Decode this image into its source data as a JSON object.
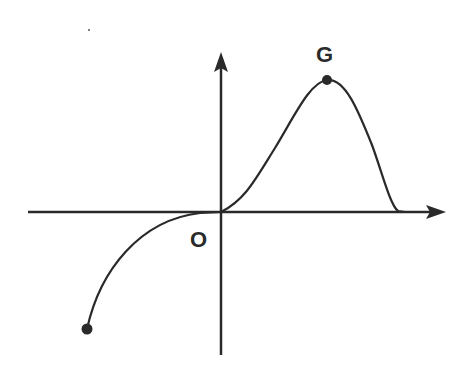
{
  "diagram": {
    "labels": {
      "origin": "O",
      "peak": "G"
    },
    "colors": {
      "stroke": "#2a2a2a",
      "background": "#ffffff"
    },
    "points": [
      {
        "name": "G",
        "x": 327,
        "y": 80
      },
      {
        "name": "left-endpoint",
        "x": 87,
        "y": 329
      },
      {
        "name": "O",
        "x": 221,
        "y": 212
      }
    ]
  }
}
